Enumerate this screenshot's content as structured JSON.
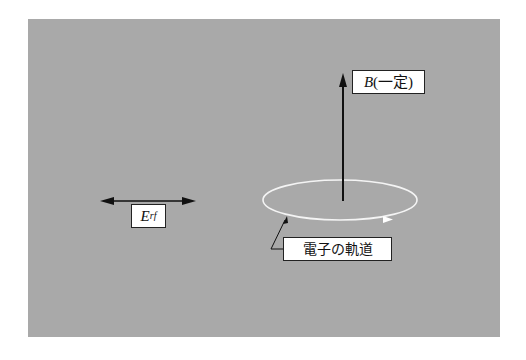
{
  "diagram": {
    "title": "",
    "background_color": "#a9a9a9",
    "labels": {
      "b_field": {
        "symbol": "B",
        "note": "(一定)"
      },
      "e_field": {
        "symbol": "E",
        "subscript": "rf"
      },
      "orbit": "電子の軌道"
    },
    "elements": [
      {
        "id": "e-field-arrow",
        "type": "double-headed-arrow",
        "orientation": "horizontal",
        "label": "E_rf"
      },
      {
        "id": "b-field-arrow",
        "type": "arrow",
        "orientation": "vertical-up",
        "label": "B(一定)"
      },
      {
        "id": "electron-orbit",
        "type": "ellipse",
        "color": "#ffffff",
        "direction_marker": "arrowhead",
        "label": "電子の軌道"
      }
    ]
  }
}
